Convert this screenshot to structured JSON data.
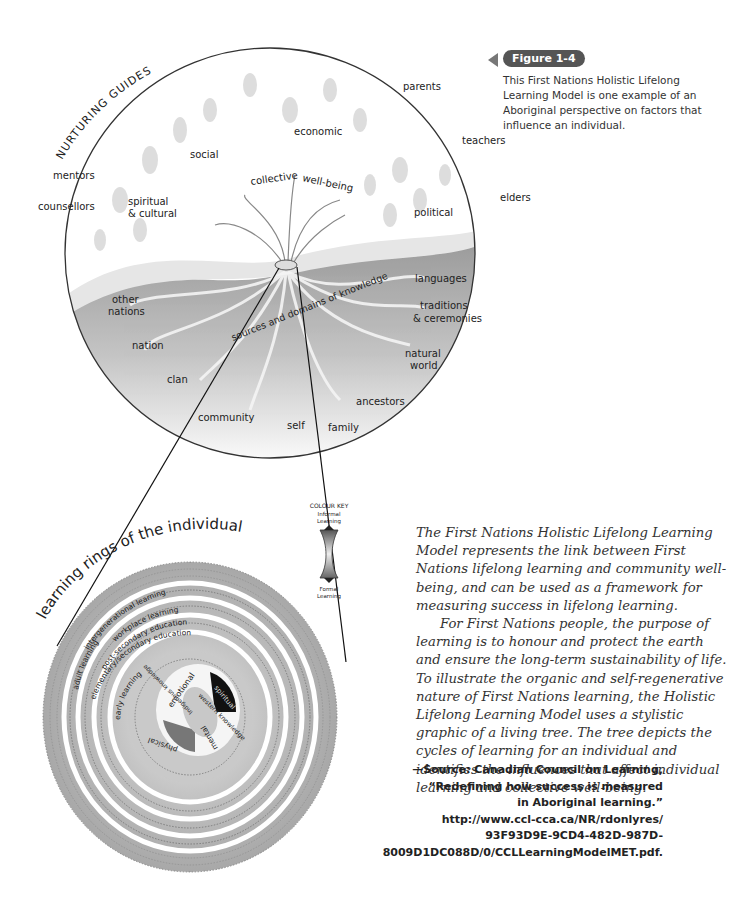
{
  "figure": {
    "badge": "Figure 1-4",
    "caption": "This First Nations Holistic Lifelong Learning Model is one example of an Aboriginal perspective on factors that influence an individual."
  },
  "tree_diagram": {
    "arc_title": "NURTURING GUIDES",
    "outer_labels": [
      "parents",
      "teachers",
      "elders",
      "mentors",
      "counsellors"
    ],
    "branches": [
      "social",
      "economic",
      "spiritual",
      "& cultural",
      "political",
      "collective",
      "well-being"
    ],
    "roots": [
      "languages",
      "traditions",
      "& ceremonies",
      "natural",
      "world",
      "ancestors",
      "family",
      "self",
      "community",
      "clan",
      "nation",
      "other",
      "nations"
    ],
    "root_caption": "sources and domains of knowledge"
  },
  "colour_key": {
    "title": "COLOUR KEY",
    "top": [
      "Informal",
      "Learning"
    ],
    "bottom": [
      "Formal",
      "Learning"
    ]
  },
  "rings": {
    "title": "learning rings of the individual",
    "rings": [
      "intergenerational learning",
      "adult learning",
      "workplace learning",
      "post-secondary education",
      "elementary/secondary education",
      "early learning"
    ],
    "core": [
      "emotional",
      "spiritual",
      "western knowledge",
      "Indigenous knowledge",
      "physical",
      "mental"
    ]
  },
  "body": {
    "p1": "The First Nations Holistic Lifelong Learning Model represents the link between First Nations lifelong learning and community well-being, and can be used as a framework for measuring success in lifelong learning.",
    "p2": "For First Nations people, the purpose of learning is to honour and protect the earth and ensure the long-term sustainability of life. To illustrate the organic and self-regenerative nature of First Nations learning, the Holistic Lifelong Learning Model uses a stylistic graphic of a living tree. The tree depicts the cycles of learning for an individual and identifies the influences that affect individual learning and collective well-being."
  },
  "source": {
    "lines": [
      "—Source: Canadian Council on Learning,",
      "“Redefining how success is measured",
      "in Aboriginal learning.”",
      "http://www.ccl-cca.ca/NR/rdonlyres/",
      "93F93D9E-9CD4-482D-987D-",
      "8009D1DC088D/0/CCLLearningModelMET.pdf."
    ]
  }
}
